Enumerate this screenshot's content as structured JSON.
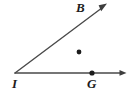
{
  "figure": {
    "type": "geometry-angle-diagram",
    "background_color": "#ffffff",
    "stroke_color": "#4a4a4a",
    "point_color": "#1c1c1c",
    "label_color": "#1c1c1c",
    "width": 133,
    "height": 96,
    "vertex": {
      "name": "I",
      "label": "I",
      "x": 15,
      "y": 73
    },
    "rays": [
      {
        "name": "ray-IB",
        "from": "I",
        "through": "B",
        "start_x": 15,
        "start_y": 73,
        "end_x": 107,
        "end_y": 4,
        "arrowhead": "end",
        "angle_degrees": 37
      },
      {
        "name": "ray-IG",
        "from": "I",
        "through": "G",
        "start_x": 15,
        "start_y": 73,
        "end_x": 126,
        "end_y": 73,
        "arrowhead": "end",
        "angle_degrees": 0
      }
    ],
    "points": [
      {
        "name": "B",
        "label": "B",
        "x": 79,
        "y": 52,
        "on_ray": "ray-IB",
        "label_position": "above-left"
      },
      {
        "name": "G",
        "label": "G",
        "x": 92,
        "y": 73,
        "on_ray": "ray-IG",
        "label_position": "below"
      }
    ]
  }
}
